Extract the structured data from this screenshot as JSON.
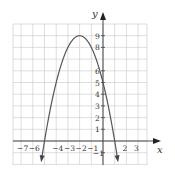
{
  "chart_data": {
    "type": "line",
    "title": "",
    "xlabel": "x",
    "ylabel": "y",
    "function": "y = -(x+2)^2 + 9",
    "vertex": [
      -2,
      9
    ],
    "x_intercepts": [
      -5,
      1
    ],
    "y_intercept": 5,
    "xlim": [
      -7.7,
      3.7
    ],
    "ylim": [
      -2,
      10
    ],
    "grid": true,
    "x_tick_labels": [
      "-7",
      "-6",
      "-4",
      "-3",
      "-2",
      "-1",
      "2",
      "3"
    ],
    "x_tick_values": [
      -7,
      -6,
      -4,
      -3,
      -2,
      -1,
      2,
      3
    ],
    "y_tick_labels": [
      "1",
      "2",
      "3",
      "4",
      "5",
      "6",
      "8",
      "9",
      "-1"
    ],
    "y_tick_values": [
      1,
      2,
      3,
      4,
      5,
      6,
      8,
      9,
      -1
    ],
    "x": [
      -5.3,
      -5,
      -4,
      -3,
      -2,
      -1,
      0,
      1,
      1.3
    ],
    "series": [
      {
        "name": "parabola",
        "values": [
          -1.89,
          0,
          5,
          8,
          9,
          8,
          5,
          0,
          -1.89
        ]
      }
    ],
    "curve_endpoints": "arrows at both ends pointing down"
  },
  "axes": {
    "x_label": "x",
    "y_label": "y"
  }
}
